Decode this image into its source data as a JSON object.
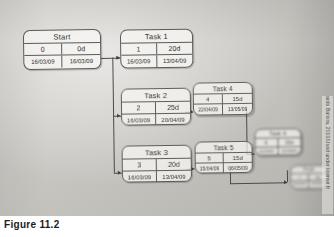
{
  "figure": {
    "caption": "Figure 11.2",
    "attribution": "ardo Batista, 2010/Used under license fr",
    "diagram_type": "precedence-network-diagram"
  },
  "legend": {
    "cell_meaning_top_left": "task id",
    "cell_meaning_top_right": "duration",
    "cell_meaning_bottom_left": "start date",
    "cell_meaning_bottom_right": "finish date"
  },
  "nodes": [
    {
      "key": "start",
      "title": "Start",
      "id": "0",
      "duration": "0d",
      "start": "16/03/09",
      "finish": "16/03/09"
    },
    {
      "key": "task1",
      "title": "Task 1",
      "id": "1",
      "duration": "20d",
      "start": "16/03/09",
      "finish": "13/04/09"
    },
    {
      "key": "task2",
      "title": "Task 2",
      "id": "2",
      "duration": "25d",
      "start": "16/03/09",
      "finish": "20/04/09"
    },
    {
      "key": "task3",
      "title": "Task 3",
      "id": "3",
      "duration": "20d",
      "start": "16/03/09",
      "finish": "13/04/09"
    },
    {
      "key": "task4",
      "title": "Task 4",
      "id": "4",
      "duration": "15d",
      "start": "22/04/09",
      "finish": "13/05/09"
    },
    {
      "key": "task5",
      "title": "Task 5",
      "id": "5",
      "duration": "15d",
      "start": "15/04/09",
      "finish": "06/05/09"
    },
    {
      "key": "task6",
      "title": "Task 6",
      "id": "6",
      "duration": "15d",
      "start": "15/05/09",
      "finish": "05/06/09"
    },
    {
      "key": "final",
      "title": "Final",
      "id": "7",
      "duration": "0d",
      "start": "05/06/09",
      "finish": "05/06/09"
    }
  ]
}
